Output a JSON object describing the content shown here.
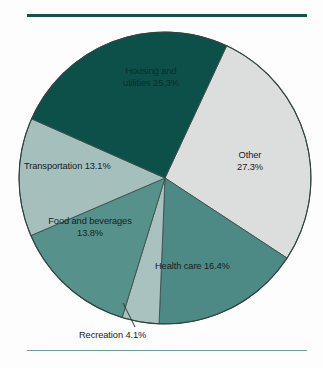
{
  "figure": {
    "title": "",
    "background_color": "#fdfdfd",
    "rule_top_color": "#14544d",
    "rule_bottom_color": "#6f9c97"
  },
  "chart_data": {
    "type": "pie",
    "title": "",
    "xlabel": "",
    "ylabel": "",
    "units": "percent",
    "total": 100.0,
    "legend_position": "none",
    "grid": false,
    "labels_inside_slices": true,
    "categories": [
      "Other",
      "Health care",
      "Recreation",
      "Food and beverages",
      "Transportation",
      "Housing and utilities"
    ],
    "values": [
      27.3,
      16.4,
      4.1,
      13.8,
      13.1,
      25.3
    ],
    "colors": [
      "#dcdedd",
      "#4e8a85",
      "#a9c2bf",
      "#57918c",
      "#a5bfbd",
      "#0d5049"
    ],
    "start_angle_deg": 25,
    "direction": "clockwise",
    "slices": [
      {
        "name": "Other",
        "value": 27.3,
        "color": "#dcdedd",
        "label_line1": "Other",
        "label_line2": "27.3%",
        "label_placement": "inside",
        "text_tone": "dark"
      },
      {
        "name": "Health care",
        "value": 16.4,
        "color": "#4e8a85",
        "label_line1": "Health care 16.4%",
        "label_line2": "",
        "label_placement": "inside",
        "text_tone": "dark"
      },
      {
        "name": "Recreation",
        "value": 4.1,
        "color": "#a9c2bf",
        "label_line1": "Recreation 4.1%",
        "label_line2": "",
        "label_placement": "outside-leader",
        "text_tone": "dark"
      },
      {
        "name": "Food and beverages",
        "value": 13.8,
        "color": "#57918c",
        "label_line1": "Food and beverages",
        "label_line2": "13.8%",
        "label_placement": "inside",
        "text_tone": "dark"
      },
      {
        "name": "Transportation",
        "value": 13.1,
        "color": "#a5bfbd",
        "label_line1": "Transportation 13.1%",
        "label_line2": "",
        "label_placement": "inside",
        "text_tone": "dark"
      },
      {
        "name": "Housing and utilities",
        "value": 25.3,
        "color": "#0d5049",
        "label_line1": "Housing and",
        "label_line2": "utilities 25.3%",
        "label_placement": "inside",
        "text_tone": "on-dark"
      }
    ]
  }
}
